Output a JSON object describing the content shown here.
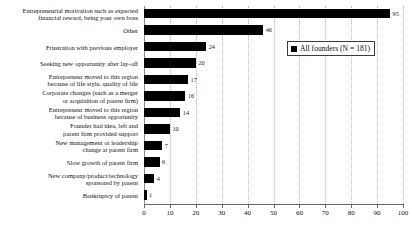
{
  "chart_data": {
    "type": "bar",
    "orientation": "horizontal",
    "title": "",
    "xlabel": "",
    "ylabel": "",
    "xlim": [
      0,
      100
    ],
    "xticks": [
      0,
      10,
      20,
      30,
      40,
      50,
      60,
      70,
      80,
      90,
      100
    ],
    "grid": "vertical-dotted",
    "legend": {
      "position": "upper-right-inset",
      "entries": [
        {
          "label": "All founders (N = 181)",
          "color": "#000000",
          "marker": "square"
        }
      ]
    },
    "bar_color": "#000000",
    "categories": [
      "Entrepreneurial motivation such as expected\nfinancial reward, being your own boss",
      "Other",
      "Frustration with previous employer",
      "Seeking new opportunity after lay-off",
      "Entrepreneur moved to this region\nbecause of life style, quality of life",
      "Corporate changes (such as a merger\nor acquisition of parent firm)",
      "Entrepreneur moved to this region\nbecause of business opportunity",
      "Founder had idea, left and\nparent firm provided support",
      "New management or leadership\nchange at parent firm",
      "Slow growth of parent firm",
      "New company/product/technology\nsponsored by parent",
      "Bankruptcy of parent"
    ],
    "series": [
      {
        "name": "All founders (N = 181)",
        "values": [
          95,
          46,
          24,
          20,
          17,
          16,
          14,
          10,
          7,
          6,
          4,
          1
        ]
      }
    ],
    "value_labels": [
      "95",
      "46",
      "24",
      "20",
      "17",
      "16",
      "14",
      "10",
      "7",
      "6",
      "4",
      "1"
    ]
  }
}
